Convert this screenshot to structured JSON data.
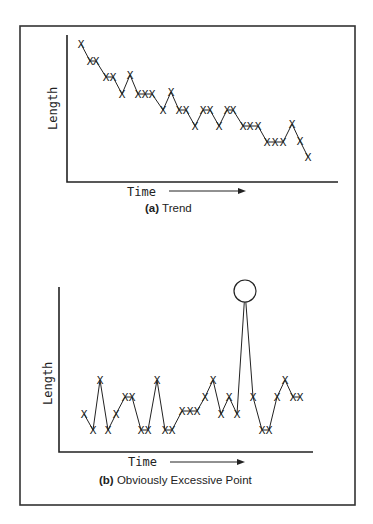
{
  "frame": {
    "border_color": "#333333"
  },
  "chart_data": [
    {
      "type": "line",
      "title": "(a) Trend",
      "caption_prefix": "(a)",
      "caption_text": "Trend",
      "xlabel": "Time",
      "ylabel": "Length",
      "grid": false,
      "marker": "X",
      "px": [
        81,
        90,
        96,
        106,
        113,
        122,
        130,
        138,
        145,
        152,
        163,
        171,
        179,
        186,
        195,
        203,
        210,
        219,
        227,
        233,
        243,
        250,
        258,
        267,
        275,
        283,
        292,
        300,
        308
      ],
      "py": [
        44,
        61,
        61,
        77,
        77,
        94,
        75,
        94,
        94,
        94,
        110,
        92,
        110,
        110,
        126,
        110,
        110,
        126,
        110,
        110,
        126,
        126,
        126,
        142,
        142,
        142,
        124,
        141,
        157
      ],
      "x": [
        1,
        2,
        3,
        4,
        5,
        6,
        7,
        8,
        9,
        10,
        11,
        12,
        13,
        14,
        15,
        16,
        17,
        18,
        19,
        20,
        21,
        22,
        23,
        24,
        25,
        26,
        27,
        28,
        29
      ],
      "values": [
        10,
        9,
        9,
        8,
        8,
        7,
        8,
        7,
        7,
        7,
        6,
        7,
        6,
        6,
        5,
        6,
        6,
        5,
        6,
        6,
        5,
        5,
        5,
        4,
        4,
        4,
        5,
        4,
        3
      ]
    },
    {
      "type": "line",
      "title": "(b) Obviously Excessive Point",
      "caption_prefix": "(b)",
      "caption_text": "Obviously Excessive Point",
      "xlabel": "Time",
      "ylabel": "Length",
      "grid": false,
      "marker": "X",
      "annotation": "circled outlier point",
      "outlier_index": 20,
      "px": [
        84,
        93,
        100,
        108,
        116,
        125,
        132,
        141,
        148,
        157,
        165,
        172,
        182,
        190,
        197,
        205,
        213,
        221,
        229,
        237,
        245,
        253,
        262,
        269,
        277,
        285,
        293,
        300
      ],
      "py": [
        414,
        430,
        380,
        430,
        414,
        397,
        397,
        430,
        430,
        380,
        430,
        430,
        411,
        411,
        411,
        397,
        380,
        414,
        397,
        414,
        291,
        397,
        430,
        430,
        397,
        380,
        397,
        397
      ],
      "x": [
        1,
        2,
        3,
        4,
        5,
        6,
        7,
        8,
        9,
        10,
        11,
        12,
        13,
        14,
        15,
        16,
        17,
        18,
        19,
        20,
        21,
        22,
        23,
        24,
        25,
        26,
        27,
        28
      ],
      "values": [
        2,
        1,
        4,
        1,
        2,
        3,
        3,
        1,
        1,
        4,
        1,
        1,
        2,
        2,
        2,
        3,
        4,
        2,
        3,
        2,
        10,
        3,
        1,
        1,
        3,
        4,
        3,
        3
      ]
    }
  ]
}
